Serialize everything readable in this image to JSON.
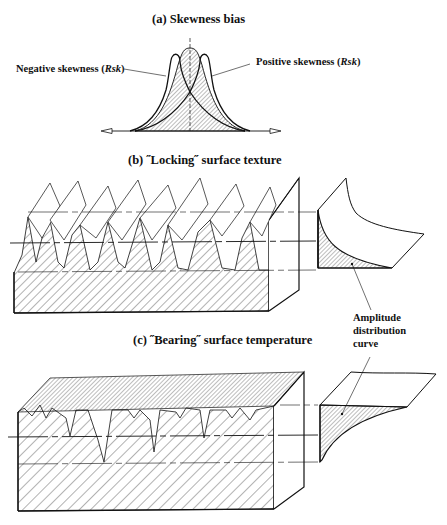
{
  "panels": {
    "a": {
      "title": "(a) Skewness bias",
      "labels": {
        "negative": "Negative skewness (",
        "negative_sym": "Rsk",
        "negative_end": ")",
        "positive": "Positive skewness (",
        "positive_sym": "Rsk",
        "positive_end": ")"
      }
    },
    "b": {
      "title": "(b) ˝Locking˝ surface texture"
    },
    "c": {
      "title": "(c) ˝Bearing˝ surface temperature"
    },
    "annotation": {
      "line1": "Amplitude",
      "line2": "distribution",
      "line3": "curve"
    }
  },
  "colors": {
    "ink": "#111111",
    "background": "#ffffff"
  }
}
